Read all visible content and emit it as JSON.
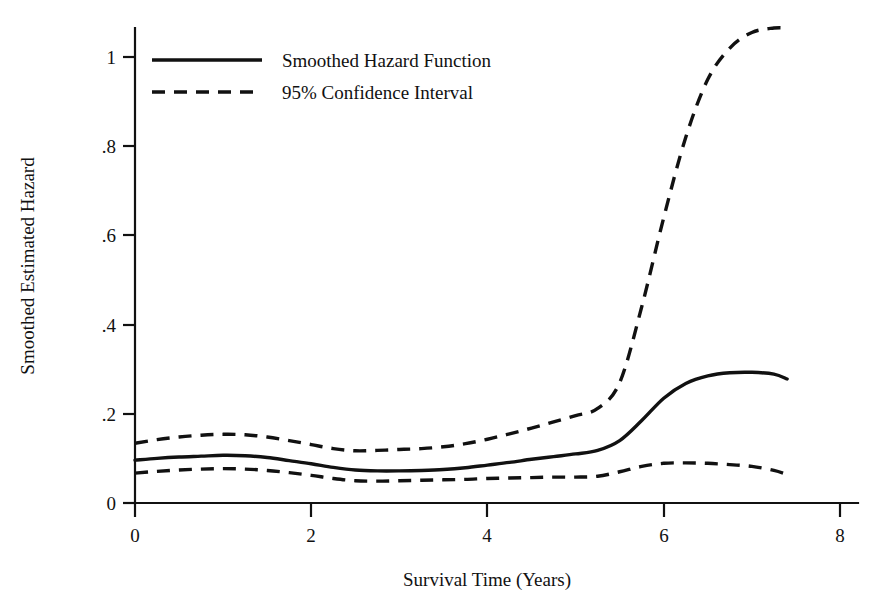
{
  "chart_data": {
    "type": "line",
    "title": "",
    "xlabel": "Survival Time (Years)",
    "ylabel": "Smoothed Estimated Hazard",
    "xlim": [
      0,
      8
    ],
    "ylim": [
      0,
      1.12
    ],
    "grid": false,
    "legend_position": "top-left",
    "xticks": [
      "0",
      "2",
      "4",
      "6",
      "8"
    ],
    "xtick_values": [
      0,
      2,
      4,
      6,
      8
    ],
    "yticks": [
      "0",
      ".2",
      ".4",
      ".6",
      ".8",
      "1"
    ],
    "ytick_values": [
      0,
      0.2,
      0.4,
      0.6,
      0.8,
      1
    ],
    "x": [
      0,
      0.25,
      0.5,
      0.75,
      1,
      1.25,
      1.5,
      1.75,
      2,
      2.25,
      2.5,
      2.75,
      3,
      3.25,
      3.5,
      3.75,
      4,
      4.25,
      4.5,
      4.75,
      5,
      5.25,
      5.5,
      5.75,
      6,
      6.25,
      6.5,
      6.75,
      7,
      7.25,
      7.4
    ],
    "series": [
      {
        "name": "Smoothed Hazard Function",
        "style": "solid",
        "values": [
          0.096,
          0.1,
          0.103,
          0.105,
          0.107,
          0.106,
          0.102,
          0.095,
          0.088,
          0.08,
          0.074,
          0.072,
          0.072,
          0.073,
          0.075,
          0.079,
          0.085,
          0.091,
          0.098,
          0.104,
          0.11,
          0.118,
          0.14,
          0.185,
          0.235,
          0.268,
          0.285,
          0.292,
          0.293,
          0.289,
          0.278
        ]
      },
      {
        "name": "95% Confidence Interval",
        "style": "dashed",
        "bound": "upper",
        "values": [
          0.134,
          0.142,
          0.148,
          0.152,
          0.154,
          0.153,
          0.148,
          0.14,
          0.131,
          0.122,
          0.117,
          0.118,
          0.12,
          0.122,
          0.126,
          0.133,
          0.143,
          0.155,
          0.168,
          0.182,
          0.196,
          0.212,
          0.27,
          0.44,
          0.64,
          0.82,
          0.95,
          1.02,
          1.055,
          1.065,
          1.065
        ]
      },
      {
        "name": "95% Confidence Interval",
        "style": "dashed",
        "bound": "lower",
        "values": [
          0.067,
          0.071,
          0.074,
          0.076,
          0.077,
          0.076,
          0.073,
          0.068,
          0.062,
          0.055,
          0.05,
          0.049,
          0.05,
          0.051,
          0.052,
          0.053,
          0.055,
          0.056,
          0.057,
          0.058,
          0.058,
          0.06,
          0.07,
          0.082,
          0.089,
          0.09,
          0.089,
          0.086,
          0.082,
          0.073,
          0.064
        ]
      }
    ],
    "legend_entries": [
      {
        "label": "Smoothed Hazard Function",
        "style": "solid"
      },
      {
        "label": "95% Confidence Interval",
        "style": "dashed"
      }
    ]
  }
}
